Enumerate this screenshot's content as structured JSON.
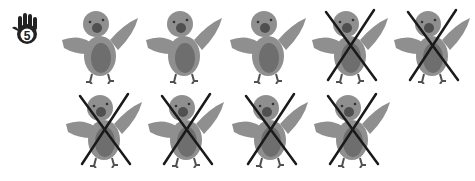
{
  "exercise": {
    "number_icon": "hand-five-icon",
    "number": "5"
  },
  "colors": {
    "bird_light": "#8f8f8f",
    "bird_belly": "#6e6e6e",
    "bird_dark": "#505050",
    "cross": "#1a1a1a",
    "hand": "#222222"
  },
  "birds": [
    {
      "row": 1,
      "index": 1,
      "crossed": false
    },
    {
      "row": 1,
      "index": 2,
      "crossed": false
    },
    {
      "row": 1,
      "index": 3,
      "crossed": false
    },
    {
      "row": 1,
      "index": 4,
      "crossed": true
    },
    {
      "row": 1,
      "index": 5,
      "crossed": true
    },
    {
      "row": 2,
      "index": 1,
      "crossed": true
    },
    {
      "row": 2,
      "index": 2,
      "crossed": true
    },
    {
      "row": 2,
      "index": 3,
      "crossed": true
    },
    {
      "row": 2,
      "index": 4,
      "crossed": true
    }
  ],
  "summary": {
    "total_birds": "9",
    "crossed_out": "6",
    "remaining": "3"
  }
}
